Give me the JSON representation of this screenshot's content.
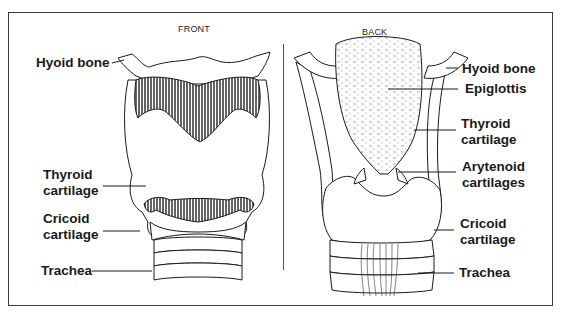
{
  "diagram": {
    "views": {
      "front": {
        "title": "FRONT",
        "labels": [
          {
            "id": "hyoid",
            "line1": "Hyoid bone",
            "line2": ""
          },
          {
            "id": "thyroid",
            "line1": "Thyroid",
            "line2": "cartilage"
          },
          {
            "id": "cricoid",
            "line1": "Cricoid",
            "line2": "cartilage"
          },
          {
            "id": "trachea",
            "line1": "Trachea",
            "line2": ""
          }
        ]
      },
      "back": {
        "title": "BACK",
        "labels": [
          {
            "id": "hyoid",
            "line1": "Hyoid bone",
            "line2": ""
          },
          {
            "id": "epiglottis",
            "line1": "Epiglottis",
            "line2": ""
          },
          {
            "id": "thyroid",
            "line1": "Thyroid",
            "line2": "cartilage"
          },
          {
            "id": "arytenoid",
            "line1": "Arytenoid",
            "line2": "cartilages"
          },
          {
            "id": "cricoid",
            "line1": "Cricoid",
            "line2": "cartilage"
          },
          {
            "id": "trachea",
            "line1": "Trachea",
            "line2": ""
          }
        ]
      }
    },
    "colors": {
      "line": "#1a1a1a",
      "fill": "#ffffff",
      "hatch": "#2a2a2a",
      "border": "#3a3a3a"
    }
  }
}
